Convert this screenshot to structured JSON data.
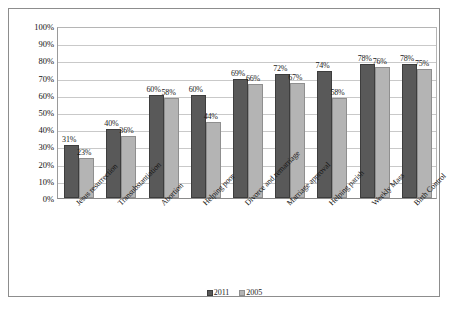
{
  "chart_data": {
    "type": "bar",
    "title": "",
    "subtitle": "",
    "xlabel": "",
    "ylabel": "",
    "ylim": [
      0,
      100
    ],
    "ytick_labels": [
      "100%",
      "90%",
      "80%",
      "70%",
      "60%",
      "50%",
      "40%",
      "30%",
      "20%",
      "10%",
      "0%"
    ],
    "ytick_values": [
      100,
      90,
      80,
      70,
      60,
      50,
      40,
      30,
      20,
      10,
      0
    ],
    "grid": true,
    "legend_position": "bottom",
    "categories": [
      "Jesus resurrection",
      "Transubstantiation",
      "Abortion",
      "Helping poor",
      "Divorce and remarriage",
      "Marriage approval",
      "Helping parish",
      "Weekly Mass",
      "Birth Control"
    ],
    "series": [
      {
        "name": "2011",
        "color": "#595959",
        "values": [
          31,
          40,
          60,
          60,
          69,
          72,
          74,
          78,
          78
        ],
        "labels": [
          "31%",
          "40%",
          "60%",
          "60%",
          "69%",
          "72%",
          "74%",
          "78%",
          "78%"
        ]
      },
      {
        "name": "2005",
        "color": "#b4b4b4",
        "values": [
          23,
          36,
          58,
          44,
          66,
          67,
          58,
          76,
          75
        ],
        "labels": [
          "23%",
          "36%",
          "58%",
          "44%",
          "66%",
          "67%",
          "58%",
          "76%",
          "75%"
        ]
      }
    ]
  }
}
